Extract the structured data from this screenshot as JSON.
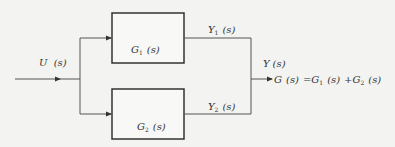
{
  "diagram": {
    "type": "block-diagram-parallel-connection",
    "input": {
      "label_main": "U",
      "label_arg": "(s)"
    },
    "blocks": [
      {
        "id": "G1",
        "label_main": "G",
        "label_sub": "1",
        "label_arg": "(s)"
      },
      {
        "id": "G2",
        "label_main": "G",
        "label_sub": "2",
        "label_arg": "(s)"
      }
    ],
    "intermediate_outputs": [
      {
        "id": "Y1",
        "label_main": "Y",
        "label_sub": "1",
        "label_arg": "(s)"
      },
      {
        "id": "Y2",
        "label_main": "Y",
        "label_sub": "2",
        "label_arg": "(s)"
      }
    ],
    "output": {
      "label_main": "Y",
      "label_arg": "(s)"
    },
    "equation": {
      "lhs_main": "G",
      "lhs_arg": "(s)",
      "eq": "=",
      "t1_main": "G",
      "t1_sub": "1",
      "t1_arg": "(s)",
      "plus": "+",
      "t2_main": "G",
      "t2_sub": "2",
      "t2_arg": "(s)"
    },
    "colors": {
      "line": "#555555",
      "box": "#333333",
      "text": "#333333",
      "background": "#f3f3f1"
    }
  }
}
